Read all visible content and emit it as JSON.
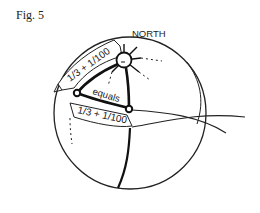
{
  "figure": {
    "label": "Fig. 5",
    "north_label": "NORTH",
    "upper_banner_text": "1/3 + 1/100",
    "middle_label": "equals",
    "lower_banner_text": "1/3 + 1/100"
  },
  "colors": {
    "ink": "#222222",
    "background": "#ffffff"
  }
}
